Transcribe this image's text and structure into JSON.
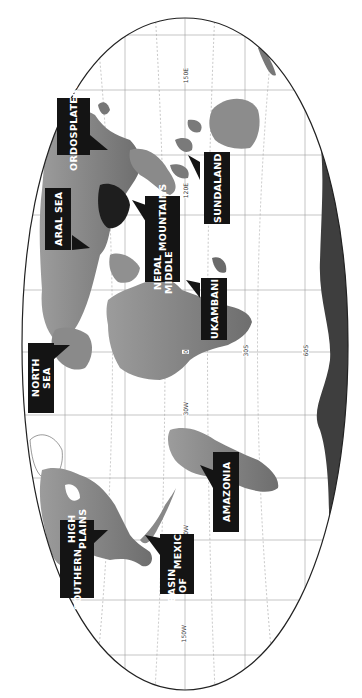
{
  "map": {
    "orientation": "rotated 90° clockwise (north at left, east at top)",
    "projection": "Robinson-like world map, grayscale relief",
    "colors": {
      "background": "#ffffff",
      "outline": "#222222",
      "land": "#8a8a8a",
      "land_dark": "#3a3a3a",
      "graticule": "#9a9a9a",
      "callout_bg": "#141414",
      "callout_text": "#ffffff"
    },
    "grid_labels": {
      "lon_150E": "150E",
      "lon_120E": "120E",
      "lat_0": "0",
      "lat_30S": "30S",
      "lat_60S": "60S",
      "lon_30W": "30W",
      "lon_90W": "90W",
      "lon_150W": "150W"
    },
    "callouts": {
      "ordos_plateau": {
        "line1": "ORDOS",
        "line2": "PLATEAU"
      },
      "sundaland": {
        "line1": "SUNDALAND"
      },
      "aral_sea": {
        "line1": "ARAL SEA"
      },
      "nepal_middle_mountains": {
        "line1": "NEPAL MIDDLE",
        "line2": "MOUNTAINS"
      },
      "ukambani": {
        "line1": "UKAMBANI"
      },
      "north_sea": {
        "line1": "NORTH SEA"
      },
      "amazonia": {
        "line1": "AMAZONIA"
      },
      "southern_high_plains": {
        "line1": "SOUTHERN",
        "line2": "HIGH PLAINS"
      },
      "basin_of_mexico": {
        "line1": "BASIN OF",
        "line2": "MEXICO"
      }
    }
  }
}
